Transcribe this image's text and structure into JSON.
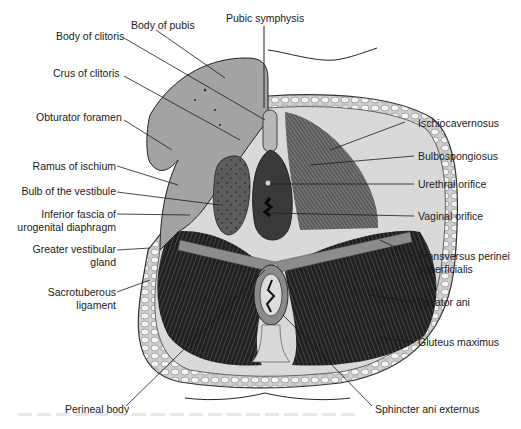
{
  "figure": {
    "type": "anatomical-diagram",
    "colors": {
      "ink": "#1a1a1a",
      "muscle_dark": "#2b2b2b",
      "muscle_mid": "#6a6a6a",
      "bone": "#9a9a9a",
      "fat": "#e8e8e8",
      "background": "#ffffff"
    }
  },
  "labels": {
    "left": {
      "body_of_pubis": "Body of pubis",
      "body_of_clitoris": "Body of clitoris",
      "crus_of_clitoris": "Crus of clitoris",
      "obturator_foramen": "Obturator foramen",
      "ramus_of_ischium": "Ramus of ischium",
      "bulb_of_vestibule": "Bulb of the vestibule",
      "inferior_fascia_1": "Inferior fascia of",
      "inferior_fascia_2": "urogenital diaphragm",
      "greater_vestibular_1": "Greater vestibular",
      "greater_vestibular_2": "gland",
      "sacrotuberous_1": "Sacrotuberous",
      "sacrotuberous_2": "ligament",
      "perineal_body": "Perineal body"
    },
    "top": {
      "pubic_symphysis": "Pubic symphysis"
    },
    "right": {
      "ischiocavernosus": "Ischiocavernosus",
      "bulbospongiosus": "Bulbospongiosus",
      "urethral_orifice": "Urethral orifice",
      "vaginal_orifice": "Vaginal orifice",
      "transversus_1": "Transversus perinei",
      "transversus_2": "superficialis",
      "levator_ani": "Levator ani",
      "gluteus_maximus": "Gluteus maximus",
      "sphincter_ani": "Sphincter ani externus"
    }
  }
}
